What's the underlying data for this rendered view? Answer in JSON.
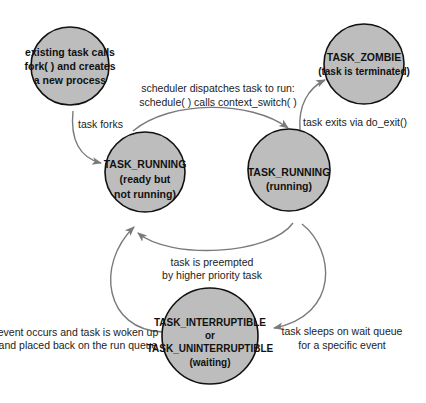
{
  "diagram": {
    "colors": {
      "node_fill": "#bdbdbd",
      "node_stroke": "#111111",
      "edge": "#7a7a7a",
      "background": "#ffffff"
    },
    "nodes": [
      {
        "id": "fork",
        "cx": 70,
        "cy": 66,
        "r": 40,
        "lines": [
          "existing task calls",
          "fork( ) and creates",
          "a new process"
        ]
      },
      {
        "id": "ready",
        "cx": 145,
        "cy": 172,
        "r": 40,
        "lines": [
          "TASK_RUNNING",
          "(ready but",
          "not running)"
        ]
      },
      {
        "id": "running",
        "cx": 289,
        "cy": 170,
        "r": 41,
        "lines": [
          "TASK_RUNNING",
          "(running)"
        ]
      },
      {
        "id": "zombie",
        "cx": 364,
        "cy": 63,
        "r": 40,
        "lines": [
          "TASK_ZOMBIE",
          "(task is terminated)"
        ]
      },
      {
        "id": "waiting",
        "cx": 210,
        "cy": 336,
        "r": 48,
        "lines": [
          "TASK_INTERRUPTIBLE",
          "or",
          "TASK_UNINTERRUPTIBLE",
          "(waiting)"
        ]
      }
    ],
    "edges": [
      {
        "id": "task-forks",
        "from": "fork",
        "to": "ready",
        "label": [
          "task forks"
        ]
      },
      {
        "id": "dispatch",
        "from": "ready",
        "to": "running",
        "label": [
          "scheduler dispatches task to run:",
          "schedule( ) calls context_switch( )"
        ]
      },
      {
        "id": "exit",
        "from": "running",
        "to": "zombie",
        "label": [
          "task exits via do_exit()"
        ]
      },
      {
        "id": "preempt",
        "from": "running",
        "to": "ready",
        "label": [
          "task is preempted",
          "by  higher priority task"
        ]
      },
      {
        "id": "sleep",
        "from": "running",
        "to": "waiting",
        "label": [
          "task sleeps on wait queue",
          "for a specific event"
        ]
      },
      {
        "id": "wakeup",
        "from": "waiting",
        "to": "ready",
        "label": [
          "event occurs and task is woken up",
          "and placed back on the run queue"
        ]
      }
    ]
  }
}
